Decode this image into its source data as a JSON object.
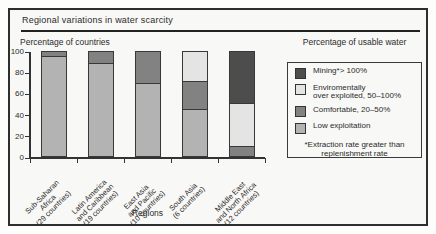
{
  "figure": {
    "title": "Regional variations in water scarcity",
    "y_axis_title": "Percentage of countries",
    "x_axis_title": "Regions"
  },
  "legend": {
    "title": "Percentage of usable water",
    "items": [
      {
        "key": "mining",
        "lines": [
          "Mining*> 100%"
        ],
        "color": "#4d4d4d"
      },
      {
        "key": "environmentally-over-exploited",
        "lines": [
          "Enviromentally",
          "over exploited, 50–100%"
        ],
        "color": "#e4e4e4"
      },
      {
        "key": "comfortable",
        "lines": [
          "Comfortable, 20–50%"
        ],
        "color": "#828282"
      },
      {
        "key": "low-exploitation",
        "lines": [
          "Low exploitation"
        ],
        "color": "#b3b3b3"
      }
    ],
    "footnote_lines": [
      "*Extraction rate greater than",
      "replenishment rate"
    ]
  },
  "chart_data": {
    "type": "bar",
    "stacked": true,
    "title": "Regional variations in water scarcity",
    "xlabel": "Regions",
    "ylabel": "Percentage of countries",
    "ylim": [
      0,
      100
    ],
    "yticks": [
      0,
      20,
      40,
      60,
      80,
      100
    ],
    "grid": false,
    "legend_position": "right",
    "categories": [
      {
        "label": "Sub-Saharan Africa (29 countries)",
        "lines": [
          "Sub-Saharan",
          "Africa",
          "(29 countries)"
        ]
      },
      {
        "label": "Latin America and Caribbean (19 countries)",
        "lines": [
          "Latin America",
          "and Caribbean",
          "(19 countries)"
        ]
      },
      {
        "label": "East Asia and Pacific (10 countries)",
        "lines": [
          "East Asia",
          "and Pacific",
          "(10 countries)"
        ]
      },
      {
        "label": "South Asia (6 countries)",
        "lines": [
          "South Asia",
          "(6 countries)"
        ]
      },
      {
        "label": "Middle East and North Africa (12 countries)",
        "lines": [
          "Middle East",
          "and North Africa",
          "(12 countries)"
        ]
      }
    ],
    "series": [
      {
        "name": "Low exploitation",
        "color": "#b3b3b3",
        "values": [
          96,
          89,
          70,
          45,
          0
        ]
      },
      {
        "name": "Comfortable, 20–50%",
        "color": "#828282",
        "values": [
          4,
          11,
          30,
          27,
          9
        ]
      },
      {
        "name": "Enviromentally over exploited, 50–100%",
        "color": "#e4e4e4",
        "values": [
          0,
          0,
          0,
          28,
          41
        ]
      },
      {
        "name": "Mining*> 100%",
        "color": "#4d4d4d",
        "values": [
          0,
          0,
          0,
          0,
          50
        ]
      }
    ]
  }
}
